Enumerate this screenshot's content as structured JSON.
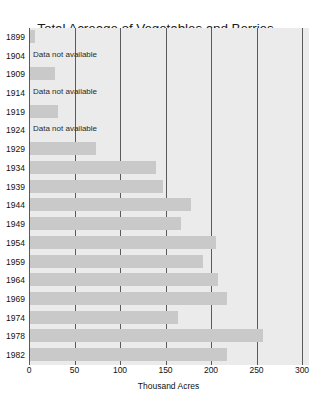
{
  "chart_data": {
    "type": "bar",
    "orientation": "horizontal",
    "title": "Total Acreage of Vegetables and Berries\nin Central and South Florida",
    "title_lines": [
      "Total Acreage of Vegetables and Berries",
      "in Central and South Florida"
    ],
    "xlabel": "Thousand Acres",
    "ylabel": "",
    "xlim": [
      0,
      300
    ],
    "xticks": [
      0,
      50,
      100,
      150,
      200,
      250,
      300
    ],
    "xtick_labels": [
      "0",
      "50",
      "100",
      "150",
      "200",
      "250",
      "300"
    ],
    "grid": "vertical",
    "legend": "none",
    "missing_label": "Data not available",
    "bar_color": "#c9c9c9",
    "plot_background": "#ebebeb",
    "axis_color": "#5a5a5a",
    "categories": [
      "1899",
      "1904",
      "1909",
      "1914",
      "1919",
      "1924",
      "1929",
      "1934",
      "1939",
      "1944",
      "1949",
      "1954",
      "1959",
      "1964",
      "1969",
      "1974",
      "1978",
      "1982"
    ],
    "values": [
      5,
      null,
      27,
      null,
      31,
      null,
      73,
      138,
      146,
      177,
      166,
      204,
      190,
      207,
      217,
      163,
      256,
      217
    ],
    "points": [
      {
        "year": "1899",
        "value": 5,
        "available": true
      },
      {
        "year": "1904",
        "value": null,
        "available": false
      },
      {
        "year": "1909",
        "value": 27,
        "available": true
      },
      {
        "year": "1914",
        "value": null,
        "available": false
      },
      {
        "year": "1919",
        "value": 31,
        "available": true
      },
      {
        "year": "1924",
        "value": null,
        "available": false
      },
      {
        "year": "1929",
        "value": 73,
        "available": true
      },
      {
        "year": "1934",
        "value": 138,
        "available": true
      },
      {
        "year": "1939",
        "value": 146,
        "available": true
      },
      {
        "year": "1944",
        "value": 177,
        "available": true
      },
      {
        "year": "1949",
        "value": 166,
        "available": true
      },
      {
        "year": "1954",
        "value": 204,
        "available": true
      },
      {
        "year": "1959",
        "value": 190,
        "available": true
      },
      {
        "year": "1964",
        "value": 207,
        "available": true
      },
      {
        "year": "1969",
        "value": 217,
        "available": true
      },
      {
        "year": "1974",
        "value": 163,
        "available": true
      },
      {
        "year": "1978",
        "value": 256,
        "available": true
      },
      {
        "year": "1982",
        "value": 217,
        "available": true
      }
    ]
  }
}
